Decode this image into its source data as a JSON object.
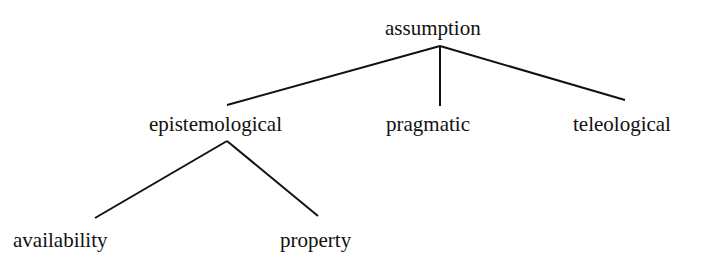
{
  "diagram": {
    "type": "tree",
    "root": {
      "label": "assumption",
      "children": [
        {
          "label": "epistemological",
          "children": [
            {
              "label": "availability"
            },
            {
              "label": "property"
            }
          ]
        },
        {
          "label": "pragmatic"
        },
        {
          "label": "teleological"
        }
      ]
    }
  },
  "nodes": {
    "assumption": "assumption",
    "epistemological": "epistemological",
    "pragmatic": "pragmatic",
    "teleological": "teleological",
    "availability": "availability",
    "property": "property"
  },
  "colors": {
    "line": "#111111",
    "text": "#111111",
    "background": "#ffffff"
  }
}
